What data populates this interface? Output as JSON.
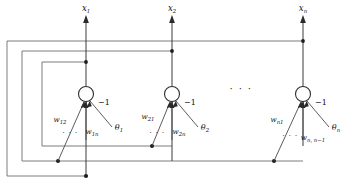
{
  "figure": {
    "type": "diagram",
    "width": 344,
    "height": 183,
    "background_color": "#ffffff",
    "line_color": "#6e6e6e",
    "ink_color": "#111111"
  },
  "outputs": [
    {
      "id": "x1",
      "base": "x",
      "sub": "1",
      "x": 86
    },
    {
      "id": "x2",
      "base": "x",
      "sub": "2",
      "x": 172
    },
    {
      "id": "xn",
      "base": "x",
      "sub": "n",
      "x": 303
    }
  ],
  "neurons": [
    {
      "id": "neuron-1",
      "cx": 86,
      "cy": 94,
      "r": 7.5,
      "bias_label": "−1",
      "threshold": {
        "base": "θ",
        "sub": "1"
      },
      "weight_left": {
        "base": "w",
        "sub": "12"
      },
      "weight_right": {
        "base": "w",
        "sub": "1n"
      },
      "dots": "· · ·"
    },
    {
      "id": "neuron-2",
      "cx": 172,
      "cy": 94,
      "r": 7.5,
      "bias_label": "−1",
      "threshold": {
        "base": "θ",
        "sub": "2"
      },
      "weight_left": {
        "base": "w",
        "sub": "21"
      },
      "weight_right": {
        "base": "w",
        "sub": "2n"
      },
      "dots": "· · ·"
    },
    {
      "id": "neuron-n",
      "cx": 303,
      "cy": 94,
      "r": 7.5,
      "bias_label": "−1",
      "threshold": {
        "base": "θ",
        "sub": "n"
      },
      "weight_left": {
        "base": "w",
        "sub": "n1"
      },
      "weight_right": {
        "base": "w",
        "sub": "n, n−1"
      },
      "dots": "· · ·"
    }
  ],
  "ellipsis_between_neurons": "· · ·",
  "feedback_loops": [
    {
      "id": "outer-loop",
      "left": 7,
      "top": 41,
      "bottom": 176,
      "right": 303
    },
    {
      "id": "middle-loop",
      "left": 22,
      "top": 51,
      "bottom": 161,
      "right": 172
    },
    {
      "id": "inner-loop",
      "left": 42,
      "top": 62,
      "bottom": 146,
      "right": 86
    }
  ]
}
